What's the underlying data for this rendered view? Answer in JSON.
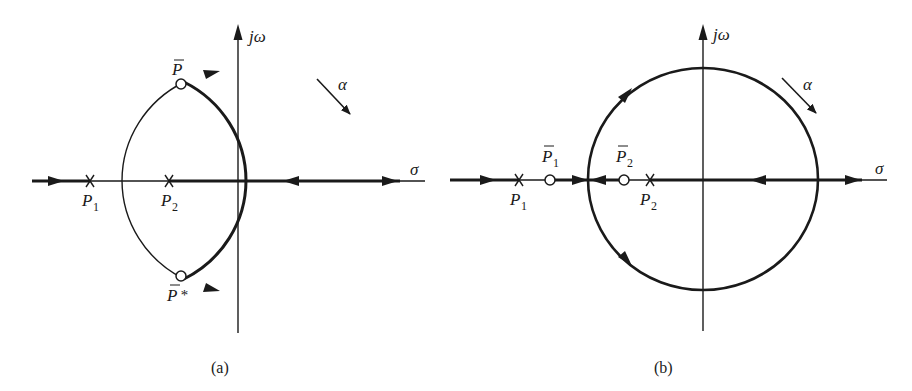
{
  "colors": {
    "ink": "#1a1a1a",
    "background": "#ffffff"
  },
  "panels": [
    {
      "id": "a",
      "caption": "(a)",
      "axes": {
        "imag_label": "jω",
        "real_label": "σ"
      },
      "rotation_label": "α",
      "poles": [
        {
          "symbol": "×",
          "label": "P",
          "subscript": "1"
        },
        {
          "symbol": "×",
          "label": "P",
          "subscript": "2"
        }
      ],
      "zeros": [
        {
          "symbol": "○",
          "label": "P",
          "bar": true,
          "suffix": ""
        },
        {
          "symbol": "○",
          "label": "P",
          "bar": true,
          "suffix": "*"
        }
      ]
    },
    {
      "id": "b",
      "caption": "(b)",
      "axes": {
        "imag_label": "jω",
        "real_label": "σ"
      },
      "rotation_label": "α",
      "poles": [
        {
          "symbol": "×",
          "label": "P",
          "subscript": "1"
        },
        {
          "symbol": "×",
          "label": "P",
          "subscript": "2"
        }
      ],
      "zeros": [
        {
          "symbol": "○",
          "label": "P",
          "bar": true,
          "subscript": "1"
        },
        {
          "symbol": "○",
          "label": "P",
          "bar": true,
          "subscript": "2"
        }
      ]
    }
  ]
}
